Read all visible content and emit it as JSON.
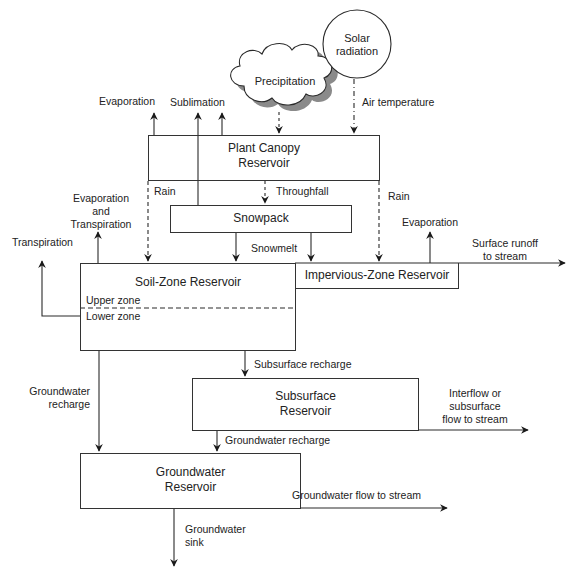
{
  "diagram": {
    "type": "flow diagram",
    "inputs": {
      "precipitation": "Precipitation",
      "solar_line1": "Solar",
      "solar_line2": "radiation",
      "air_temperature": "Air temperature"
    },
    "reservoirs": {
      "plant_canopy_line1": "Plant Canopy",
      "plant_canopy_line2": "Reservoir",
      "snowpack": "Snowpack",
      "soil_zone": "Soil-Zone Reservoir",
      "upper_zone": "Upper zone",
      "lower_zone": "Lower zone",
      "impervious_zone": "Impervious-Zone Reservoir",
      "subsurface_line1": "Subsurface",
      "subsurface_line2": "Reservoir",
      "groundwater_line1": "Groundwater",
      "groundwater_line2": "Reservoir"
    },
    "flows": {
      "evaporation_canopy": "Evaporation",
      "sublimation": "Sublimation",
      "rain_left": "Rain",
      "throughfall": "Throughfall",
      "rain_right": "Rain",
      "snowmelt": "Snowmelt",
      "evap_transp_line1": "Evaporation",
      "evap_transp_line2": "and",
      "evap_transp_line3": "Transpiration",
      "transpiration": "Transpiration",
      "evaporation_impervious": "Evaporation",
      "surface_runoff_line1": "Surface runoff",
      "surface_runoff_line2": "to stream",
      "subsurface_recharge": "Subsurface recharge",
      "gw_recharge_left_line1": "Groundwater",
      "gw_recharge_left_line2": "recharge",
      "gw_recharge_sub": "Groundwater recharge",
      "interflow_line1": "Interflow or",
      "interflow_line2": "subsurface",
      "interflow_line3": "flow to stream",
      "gw_flow": "Groundwater flow to stream",
      "gw_sink_line1": "Groundwater",
      "gw_sink_line2": "sink"
    },
    "colors": {
      "line": "#2a2a2a",
      "cloud_fill": "#ffffff",
      "cloud_shadow": "#8a8a8a",
      "background": "#ffffff"
    }
  }
}
